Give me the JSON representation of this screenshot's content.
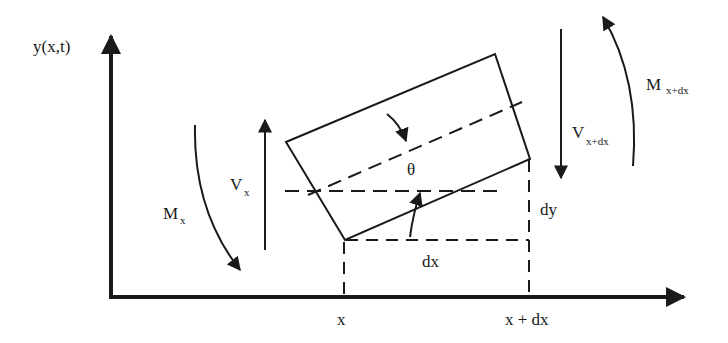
{
  "diagram": {
    "colors": {
      "ink": "#1a1a1a",
      "background": "#ffffff"
    },
    "axes": {
      "y_label": "y(x,t)",
      "x_tick_left": "x",
      "x_tick_right": "x + dx"
    },
    "labels": {
      "theta": "θ",
      "dx": "dx",
      "dy": "dy",
      "shear_left_main": "V",
      "shear_left_sub": "x",
      "shear_right_main": "V",
      "shear_right_sub": "x+dx",
      "moment_left_main": "M",
      "moment_left_sub": "x",
      "moment_right_main": "M",
      "moment_right_sub": "x+dx"
    }
  }
}
